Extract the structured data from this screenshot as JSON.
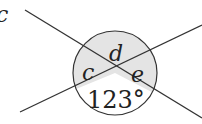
{
  "diagram": {
    "type": "intersecting-lines-angles",
    "corner_fragment": "c",
    "labels": {
      "top": "d",
      "left": "c",
      "right": "e",
      "bottom": "123°"
    },
    "colors": {
      "line": "#333333",
      "shade": "#e4e4e4",
      "unshaded": "#ffffff",
      "text": "#222222"
    }
  }
}
